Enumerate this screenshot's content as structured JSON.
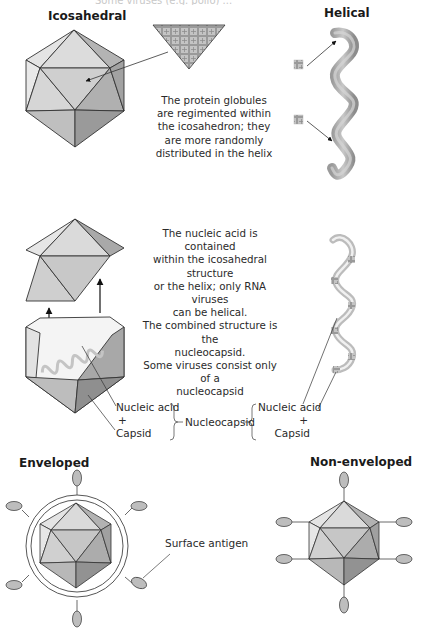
{
  "figure": {
    "top_cut_text": "Some viruses (e.g. polio) ... ",
    "sections": {
      "icosahedral": {
        "heading": "Icosahedral"
      },
      "helical": {
        "heading": "Helical"
      },
      "enveloped": {
        "heading": "Enveloped"
      },
      "non_enveloped": {
        "heading": "Non-enveloped"
      }
    },
    "captions": {
      "protein_globules": "The protein globules are regimented within the icosahedron; they are more randomly distributed in the helix",
      "nucleic_acid": [
        "The nucleic acid is contained",
        "within the icosahedral structure",
        "or the helix; only RNA viruses",
        "can be helical.",
        "The combined structure is the",
        "nucleocapsid.",
        "Some viruses consist only of a",
        "nucleocapsid"
      ]
    },
    "labels": {
      "left_group": {
        "line1": "Nucleic acid",
        "plus": "+",
        "line2": "Capsid"
      },
      "center": "Nucleocapsid",
      "right_group": {
        "line1": "Nucleic acid",
        "plus": "+",
        "line2": "Capsid"
      },
      "surface_antigen": "Surface antigen"
    },
    "colors": {
      "face_light": "#e6e6e6",
      "face_mid": "#cfcfcf",
      "face_dark": "#a9a9a9",
      "face_darker": "#8f8f8f",
      "helix": "#a8a8a8",
      "outline": "#333333",
      "antigen": "#bdbdbd"
    }
  }
}
